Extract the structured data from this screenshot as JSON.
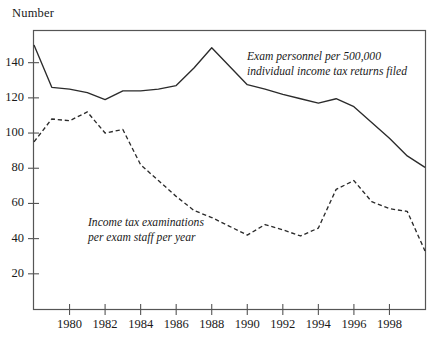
{
  "axis_title": "Number",
  "annotations": {
    "solid_line": [
      "Exam personnel per 500,000",
      "individual income tax returns filed"
    ],
    "dashed_line": [
      "Income tax examinations",
      "per exam staff  per year"
    ]
  },
  "colors": {
    "line": "#2b2b2b",
    "axis": "#555555",
    "text": "#1a1a1a",
    "background": "#ffffff"
  },
  "chart_data": {
    "type": "line",
    "title": "",
    "subtitle": "",
    "xlabel": "",
    "ylabel": "Number",
    "xlim": [
      1978,
      2000
    ],
    "ylim": [
      0,
      158
    ],
    "grid": false,
    "legend": "inline-annotations",
    "y_ticks": [
      20,
      40,
      60,
      80,
      100,
      120,
      140
    ],
    "x_ticks": [
      1980,
      1982,
      1984,
      1986,
      1988,
      1990,
      1992,
      1994,
      1996,
      1998
    ],
    "x_tick_labels": [
      "1980",
      "1982",
      "1984",
      "1986",
      "1988",
      "1990",
      "1992",
      "1994",
      "1996",
      "1998"
    ],
    "y_tick_labels": [
      "20",
      "40",
      "60",
      "80",
      "100",
      "120",
      "140"
    ],
    "x": [
      1978,
      1979,
      1980,
      1981,
      1982,
      1983,
      1984,
      1985,
      1986,
      1987,
      1988,
      1989,
      1990,
      1991,
      1992,
      1993,
      1994,
      1995,
      1996,
      1997,
      1998,
      1999,
      2000
    ],
    "series": [
      {
        "name": "Exam personnel per 500,000 individual income tax returns filed",
        "style": "solid",
        "values": [
          150,
          126,
          125,
          123,
          119,
          124,
          124,
          125,
          127,
          137,
          148.5,
          138,
          127.5,
          125,
          122,
          119.5,
          117,
          119.5,
          115,
          106,
          97,
          87,
          80.5
        ]
      },
      {
        "name": "Income tax examinations per exam staff per year",
        "style": "dashed",
        "values": [
          95,
          108,
          107,
          112,
          100,
          102,
          82,
          73,
          64,
          56,
          52,
          47,
          42,
          48,
          45,
          41.5,
          46,
          68,
          73,
          61,
          57,
          55.5,
          33
        ]
      }
    ]
  }
}
